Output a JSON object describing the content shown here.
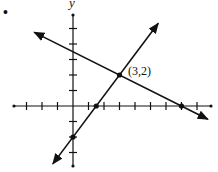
{
  "problem_marker": "•",
  "axes": {
    "y_label": "y",
    "origin_px": [
      73,
      106
    ],
    "unit_px": 15.5,
    "x_ticks": [
      -3,
      -2,
      -1,
      1,
      2,
      3,
      4,
      5,
      6,
      7,
      8
    ],
    "y_ticks": [
      -3,
      -2,
      -1,
      1,
      2,
      3,
      4,
      5
    ]
  },
  "intersection": {
    "label": "(3,2)",
    "x": 3,
    "y": 2
  },
  "lines": [
    {
      "name": "decreasing-line",
      "equation": "y = -x/2 + 7/2",
      "slope": -0.5,
      "intercept": 3.5,
      "x_range": [
        -2.5,
        8.7
      ]
    },
    {
      "name": "increasing-line",
      "equation": "y = 4x/3 - 2",
      "slope": 1.3333,
      "intercept": -2,
      "x_range": [
        -1.3,
        5.5
      ]
    }
  ],
  "marked_points": [
    {
      "x": 3,
      "y": 2
    },
    {
      "x": 7,
      "y": 0
    },
    {
      "x": 1.5,
      "y": 0
    },
    {
      "x": 0,
      "y": -2
    }
  ],
  "colors": {
    "ink": "#111111",
    "background": "#ffffff"
  }
}
